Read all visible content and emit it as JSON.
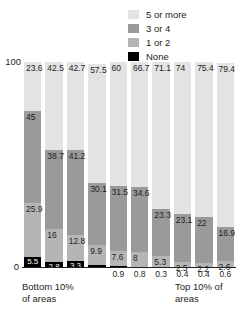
{
  "legend": {
    "items": [
      {
        "label": "5 or more",
        "color": "#e3e3e3",
        "key": "five_or_more"
      },
      {
        "label": "3 or 4",
        "color": "#9a9a9a",
        "key": "three_or_four"
      },
      {
        "label": "1 or 2",
        "color": "#b5b5b5",
        "key": "one_or_two"
      },
      {
        "label": "None",
        "color": "#000000",
        "key": "none"
      }
    ]
  },
  "axis": {
    "y_top_label": "100",
    "y_bottom_label": "0",
    "ylim": [
      0,
      100
    ]
  },
  "captions": {
    "left": "Bottom 10% of areas",
    "right": "Top 10% of areas"
  },
  "chart_data": {
    "type": "bar",
    "subtype": "stacked-100-percent",
    "title": "",
    "xlabel": "",
    "ylabel": "",
    "ylim": [
      0,
      100
    ],
    "grid": false,
    "legend_position": "top-right",
    "categories": [
      "1",
      "2",
      "3",
      "4",
      "5",
      "6",
      "7",
      "8",
      "9",
      "10"
    ],
    "category_captions": {
      "first": "Bottom 10% of areas",
      "last": "Top 10% of areas"
    },
    "series": [
      {
        "name": "None",
        "color": "#000000",
        "values": [
          5.5,
          2.8,
          3.3,
          1.5,
          0.9,
          0.8,
          0.3,
          0.4,
          0.4,
          0.6
        ]
      },
      {
        "name": "1 or 2",
        "color": "#b5b5b5",
        "values": [
          25.9,
          16,
          12.8,
          9.9,
          7.6,
          8,
          5.3,
          2.5,
          2.2,
          2.6
        ]
      },
      {
        "name": "3 or 4",
        "color": "#9a9a9a",
        "values": [
          45,
          38.7,
          41.2,
          30.1,
          31.5,
          34.6,
          23.3,
          23.1,
          22,
          16.9
        ]
      },
      {
        "name": "5 or more",
        "color": "#e3e3e3",
        "values": [
          23.6,
          42.5,
          42.7,
          57.5,
          60,
          66.7,
          71.1,
          74,
          75.4,
          79.4
        ]
      }
    ],
    "value_labels": {
      "none": [
        "5.5",
        "2.8",
        "3.3",
        "1.5",
        "0.9",
        "0.8",
        "0.3",
        "0.4",
        "0.4",
        "0.6"
      ],
      "one_or_two": [
        "25.9",
        "16",
        "12.8",
        "9.9",
        "7.6",
        "8",
        "5.3",
        "2.5",
        "2.2",
        "2.6"
      ],
      "three_or_four": [
        "45",
        "38.7",
        "41.2",
        "30.1",
        "31.5",
        "34.6",
        "23.3",
        "23.1",
        "22",
        "16.9"
      ],
      "five_or_more": [
        "23.6",
        "42.5",
        "42.7",
        "57.5",
        "60",
        "66.7",
        "71.1",
        "74",
        "75.4",
        "79.4"
      ]
    },
    "none_labels_below_axis": [
      false,
      false,
      false,
      false,
      true,
      true,
      true,
      true,
      true,
      true
    ]
  }
}
